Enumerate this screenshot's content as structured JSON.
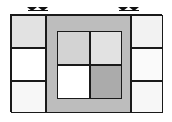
{
  "diagram": {
    "title": "Partitioned Rectangle Layout",
    "caption": "",
    "canvas": {
      "width": 172,
      "height": 122,
      "background": "#ffffff"
    },
    "frame": {
      "label": "outer-rectangle",
      "x": 10,
      "y": 14,
      "width": 152,
      "height": 98,
      "stroke": "#1a1a1a",
      "stroke_width": 1.4,
      "fill": "#ffffff"
    },
    "palette": {
      "white": "#ffffff",
      "near_white": "#fafafa",
      "very_light_gray": "#f2f2f2",
      "light_gray": "#e2e2e2",
      "mid_light_gray": "#d3d3d3",
      "mid_gray": "#bdbdbd",
      "dark_gray": "#ababab",
      "stroke": "#1a1a1a"
    },
    "markers": [
      {
        "label": "top-left-marker-pair",
        "x": 27,
        "y": 5,
        "glyph": "down-arrow-pair"
      },
      {
        "label": "top-right-marker-pair",
        "x": 118,
        "y": 5,
        "glyph": "down-arrow-pair"
      }
    ],
    "left_column": {
      "label": "left-column",
      "x": 10,
      "y": 14,
      "width": 35,
      "height": 98,
      "cells": [
        {
          "label": "left-cell-top",
          "x": 10,
          "y": 14,
          "width": 35,
          "height": 33,
          "fill": "#e2e2e2"
        },
        {
          "label": "left-cell-middle",
          "x": 10,
          "y": 47,
          "width": 35,
          "height": 33,
          "fill": "#ffffff"
        },
        {
          "label": "left-cell-bottom",
          "x": 10,
          "y": 80,
          "width": 35,
          "height": 32,
          "fill": "#f7f7f7"
        }
      ]
    },
    "right_column": {
      "label": "right-column",
      "x": 130,
      "y": 14,
      "width": 32,
      "height": 98,
      "cells": [
        {
          "label": "right-cell-top",
          "x": 130,
          "y": 14,
          "width": 32,
          "height": 33,
          "fill": "#f2f2f2"
        },
        {
          "label": "right-cell-middle",
          "x": 130,
          "y": 47,
          "width": 32,
          "height": 33,
          "fill": "#fafafa"
        },
        {
          "label": "right-cell-bottom",
          "x": 130,
          "y": 80,
          "width": 32,
          "height": 32,
          "fill": "#f7f7f7"
        }
      ]
    },
    "center_block": {
      "label": "center-block",
      "x": 45,
      "y": 14,
      "width": 85,
      "height": 98,
      "fill": "#bdbdbd",
      "inner_grid": {
        "label": "inner-2x2-grid",
        "x": 55,
        "y": 29,
        "width": 65,
        "height": 68,
        "cells": [
          {
            "label": "inner-cell-top-left",
            "x": 55,
            "y": 29,
            "width": 33,
            "height": 34,
            "fill": "#d3d3d3"
          },
          {
            "label": "inner-cell-top-right",
            "x": 88,
            "y": 29,
            "width": 32,
            "height": 34,
            "fill": "#e2e2e2"
          },
          {
            "label": "inner-cell-bottom-left",
            "x": 55,
            "y": 63,
            "width": 33,
            "height": 34,
            "fill": "#ffffff"
          },
          {
            "label": "inner-cell-bottom-right",
            "x": 88,
            "y": 63,
            "width": 32,
            "height": 34,
            "fill": "#ababab"
          }
        ]
      }
    }
  }
}
